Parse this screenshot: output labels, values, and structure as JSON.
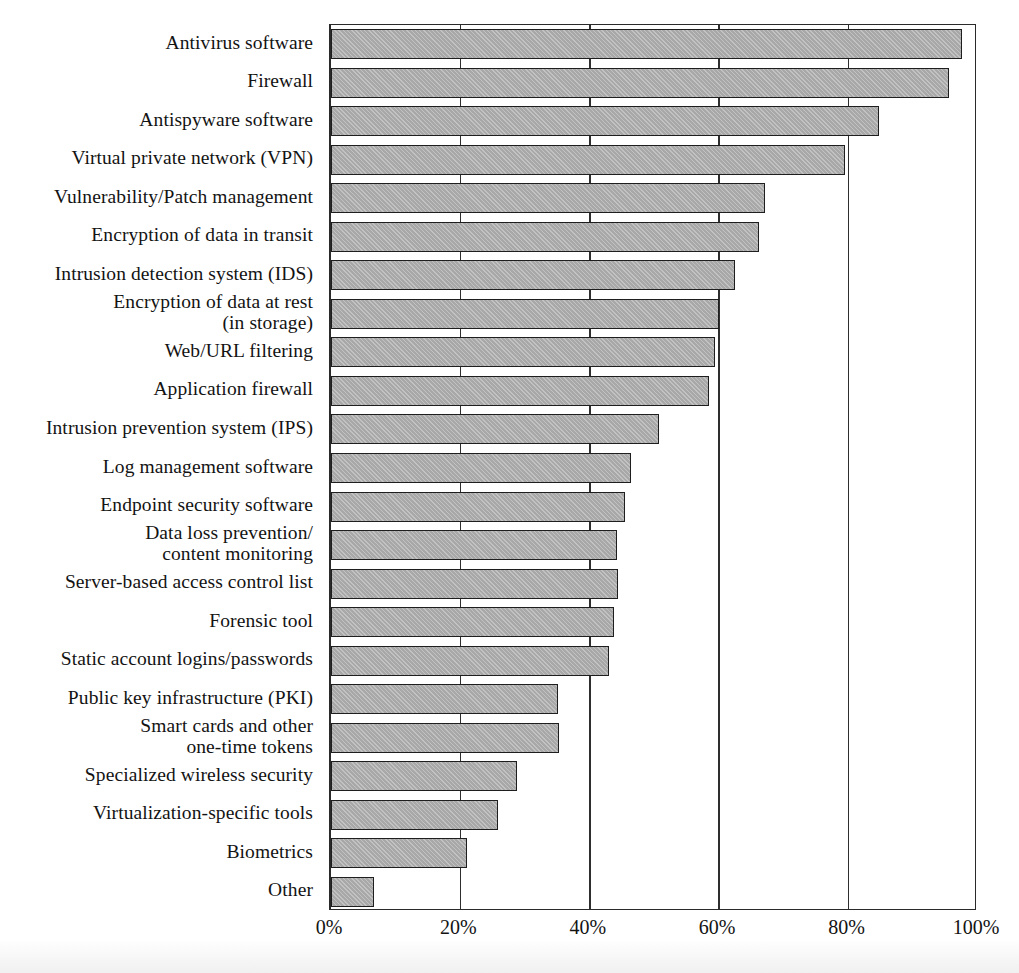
{
  "chart_data": {
    "type": "bar",
    "orientation": "horizontal",
    "title": "",
    "xlabel": "",
    "ylabel": "",
    "xlim": [
      0,
      100
    ],
    "xticks": [
      "0%",
      "20%",
      "40%",
      "60%",
      "80%",
      "100%"
    ],
    "xtick_values": [
      0,
      20,
      40,
      60,
      80,
      100
    ],
    "grid": "vertical",
    "legend": "none",
    "value_suffix": "%",
    "categories": [
      "Antivirus software",
      "Firewall",
      "Antispyware software",
      "Virtual private network (VPN)",
      "Vulnerability/Patch management",
      "Encryption of data in transit",
      "Intrusion detection system (IDS)",
      "Encryption of data at rest\n(in storage)",
      "Web/URL filtering",
      "Application firewall",
      "Intrusion prevention system (IPS)",
      "Log management software",
      "Endpoint security software",
      "Data loss prevention/\ncontent monitoring",
      "Server-based access control list",
      "Forensic tool",
      "Static account logins/passwords",
      "Public key infrastructure (PKI)",
      "Smart cards and other\none-time tokens",
      "Specialized wireless security",
      "Virtualization-specific tools",
      "Biometrics",
      "Other"
    ],
    "values": [
      97.5,
      95.5,
      84.7,
      79.5,
      67.1,
      66.2,
      62.5,
      60.0,
      59.4,
      58.4,
      50.7,
      46.4,
      45.4,
      44.2,
      44.3,
      43.7,
      43.0,
      35.1,
      35.2,
      28.8,
      25.8,
      21.0,
      6.7
    ],
    "colors": {
      "bar_fill": "#a8a8a8",
      "bar_border": "#1e1e1e",
      "axis": "#2a2a2a",
      "text": "#131313",
      "background": "#ffffff"
    }
  }
}
